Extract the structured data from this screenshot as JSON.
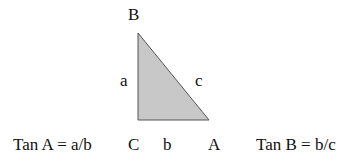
{
  "diagram": {
    "type": "right-triangle",
    "fill_color": "#c8c8c8",
    "edge_color": "#555555",
    "vertices": {
      "B": "B",
      "C": "C",
      "A": "A"
    },
    "sides": {
      "a": "a",
      "b": "b",
      "c": "c"
    },
    "formulas": {
      "tan_a": "Tan A = a/b",
      "tan_b": "Tan B = b/c"
    }
  }
}
